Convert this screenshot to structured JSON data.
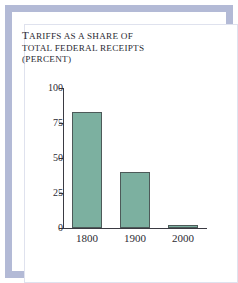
{
  "figure": {
    "frame_color": "#b3bad6",
    "background_color": "#ffffff"
  },
  "chart_data": {
    "type": "bar",
    "title": "TARIFFS AS A SHARE OF TOTAL FEDERAL RECEIPTS (PERCENT)",
    "title_lines": [
      "TARIFFS AS A SHARE OF",
      "TOTAL FEDERAL RECEIPTS",
      "(PERCENT)"
    ],
    "categories": [
      "1800",
      "1900",
      "2000"
    ],
    "values": [
      83,
      40,
      2
    ],
    "xlabel": "",
    "ylabel": "",
    "ylim": [
      0,
      100
    ],
    "yticks": [
      "0",
      "25",
      "50",
      "75",
      "100"
    ],
    "ytick_values": [
      0,
      25,
      50,
      75,
      100
    ],
    "grid": false,
    "legend": false,
    "bar_color": "#7cb0a0",
    "bar_edge_color": "#4d5a59",
    "axis_color": "#3a3a42"
  }
}
